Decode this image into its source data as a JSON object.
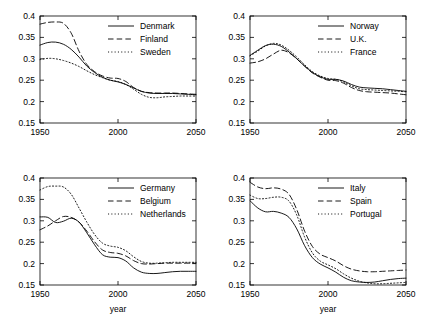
{
  "figure": {
    "width": 423,
    "height": 322,
    "background": "#ffffff",
    "line_color": "#000000"
  },
  "axes": {
    "xlabel": "year",
    "ylabel": "",
    "xlim": [
      1950,
      2050
    ],
    "ylim": [
      0.15,
      0.4
    ],
    "xticks": [
      1950,
      2000,
      2050
    ],
    "xticklabels": [
      "1950",
      "2000",
      "2050"
    ],
    "yticks": [
      0.15,
      0.2,
      0.25,
      0.3,
      0.35,
      0.4
    ],
    "yticklabels": [
      "0.15",
      "0.2",
      "0.25",
      "0.3",
      "0.35",
      "0.4"
    ],
    "grid": false,
    "legend_position": "upper right"
  },
  "chart_data": [
    {
      "type": "line",
      "panel": "top-left",
      "title": "",
      "xlabel": "",
      "ylabel": "",
      "xlim": [
        1950,
        2050
      ],
      "ylim": [
        0.15,
        0.4
      ],
      "xticks": [
        1950,
        2000,
        2050
      ],
      "yticks": [
        0.15,
        0.2,
        0.25,
        0.3,
        0.35,
        0.4
      ],
      "x": [
        1950,
        1955,
        1960,
        1965,
        1970,
        1975,
        1980,
        1985,
        1990,
        1995,
        2000,
        2005,
        2010,
        2015,
        2020,
        2025,
        2030,
        2035,
        2040,
        2045,
        2050
      ],
      "series": [
        {
          "name": "Denmark",
          "style": "solid",
          "values": [
            0.332,
            0.338,
            0.339,
            0.334,
            0.322,
            0.304,
            0.283,
            0.268,
            0.257,
            0.25,
            0.246,
            0.24,
            0.232,
            0.224,
            0.22,
            0.219,
            0.219,
            0.219,
            0.218,
            0.217,
            0.216
          ]
        },
        {
          "name": "Finland",
          "style": "dashed",
          "values": [
            0.381,
            0.385,
            0.386,
            0.383,
            0.36,
            0.318,
            0.287,
            0.27,
            0.26,
            0.255,
            0.254,
            0.247,
            0.233,
            0.224,
            0.221,
            0.22,
            0.22,
            0.22,
            0.219,
            0.218,
            0.217
          ]
        },
        {
          "name": "Sweden",
          "style": "dotted",
          "values": [
            0.298,
            0.301,
            0.3,
            0.296,
            0.29,
            0.282,
            0.272,
            0.263,
            0.256,
            0.25,
            0.247,
            0.24,
            0.229,
            0.217,
            0.21,
            0.209,
            0.211,
            0.212,
            0.213,
            0.213,
            0.213
          ]
        }
      ]
    },
    {
      "type": "line",
      "panel": "top-right",
      "title": "",
      "xlabel": "",
      "ylabel": "",
      "xlim": [
        1950,
        2050
      ],
      "ylim": [
        0.15,
        0.4
      ],
      "xticks": [
        1950,
        2000,
        2050
      ],
      "yticks": [
        0.15,
        0.2,
        0.25,
        0.3,
        0.35,
        0.4
      ],
      "x": [
        1950,
        1955,
        1960,
        1965,
        1970,
        1975,
        1980,
        1985,
        1990,
        1995,
        2000,
        2005,
        2010,
        2015,
        2020,
        2025,
        2030,
        2035,
        2040,
        2045,
        2050
      ],
      "series": [
        {
          "name": "Norway",
          "style": "solid",
          "values": [
            0.308,
            0.32,
            0.331,
            0.334,
            0.329,
            0.316,
            0.3,
            0.283,
            0.268,
            0.258,
            0.252,
            0.252,
            0.248,
            0.24,
            0.234,
            0.232,
            0.231,
            0.23,
            0.228,
            0.226,
            0.224
          ]
        },
        {
          "name": "U.K.",
          "style": "dashed",
          "values": [
            0.29,
            0.293,
            0.3,
            0.311,
            0.32,
            0.314,
            0.3,
            0.283,
            0.267,
            0.257,
            0.25,
            0.249,
            0.243,
            0.233,
            0.226,
            0.223,
            0.222,
            0.221,
            0.22,
            0.218,
            0.216
          ]
        },
        {
          "name": "France",
          "style": "dotted",
          "values": [
            0.307,
            0.318,
            0.33,
            0.336,
            0.332,
            0.32,
            0.304,
            0.286,
            0.27,
            0.26,
            0.254,
            0.252,
            0.246,
            0.237,
            0.23,
            0.228,
            0.227,
            0.226,
            0.225,
            0.224,
            0.223
          ]
        }
      ]
    },
    {
      "type": "line",
      "panel": "bottom-left",
      "title": "",
      "xlabel": "year",
      "ylabel": "",
      "xlim": [
        1950,
        2050
      ],
      "ylim": [
        0.15,
        0.4
      ],
      "xticks": [
        1950,
        2000,
        2050
      ],
      "yticks": [
        0.15,
        0.2,
        0.25,
        0.3,
        0.35,
        0.4
      ],
      "x": [
        1950,
        1955,
        1960,
        1965,
        1970,
        1975,
        1980,
        1985,
        1990,
        1995,
        2000,
        2005,
        2010,
        2015,
        2020,
        2025,
        2030,
        2035,
        2040,
        2045,
        2050
      ],
      "series": [
        {
          "name": "Germany",
          "style": "solid",
          "values": [
            0.309,
            0.308,
            0.296,
            0.299,
            0.306,
            0.297,
            0.272,
            0.244,
            0.221,
            0.215,
            0.214,
            0.206,
            0.19,
            0.18,
            0.177,
            0.177,
            0.179,
            0.181,
            0.182,
            0.182,
            0.182
          ]
        },
        {
          "name": "Belgium",
          "style": "dashed",
          "values": [
            0.279,
            0.288,
            0.3,
            0.31,
            0.308,
            0.297,
            0.276,
            0.251,
            0.232,
            0.226,
            0.224,
            0.218,
            0.207,
            0.2,
            0.199,
            0.2,
            0.201,
            0.201,
            0.201,
            0.201,
            0.201
          ]
        },
        {
          "name": "Netherlands",
          "style": "dotted",
          "values": [
            0.372,
            0.38,
            0.381,
            0.379,
            0.362,
            0.33,
            0.297,
            0.268,
            0.248,
            0.241,
            0.238,
            0.23,
            0.216,
            0.205,
            0.201,
            0.201,
            0.202,
            0.203,
            0.203,
            0.203,
            0.203
          ]
        }
      ]
    },
    {
      "type": "line",
      "panel": "bottom-right",
      "title": "",
      "xlabel": "year",
      "ylabel": "",
      "xlim": [
        1950,
        2050
      ],
      "ylim": [
        0.15,
        0.4
      ],
      "xticks": [
        1950,
        2000,
        2050
      ],
      "yticks": [
        0.15,
        0.2,
        0.25,
        0.3,
        0.35,
        0.4
      ],
      "x": [
        1950,
        1955,
        1960,
        1965,
        1970,
        1975,
        1980,
        1985,
        1990,
        1995,
        2000,
        2005,
        2010,
        2015,
        2020,
        2025,
        2030,
        2035,
        2040,
        2045,
        2050
      ],
      "series": [
        {
          "name": "Italy",
          "style": "solid",
          "values": [
            0.347,
            0.33,
            0.321,
            0.322,
            0.318,
            0.308,
            0.281,
            0.242,
            0.214,
            0.199,
            0.19,
            0.18,
            0.168,
            0.16,
            0.157,
            0.156,
            0.157,
            0.16,
            0.163,
            0.165,
            0.166
          ]
        },
        {
          "name": "Spain",
          "style": "dashed",
          "values": [
            0.39,
            0.379,
            0.375,
            0.377,
            0.374,
            0.362,
            0.326,
            0.276,
            0.24,
            0.222,
            0.214,
            0.206,
            0.195,
            0.187,
            0.183,
            0.181,
            0.181,
            0.182,
            0.183,
            0.184,
            0.185
          ]
        },
        {
          "name": "Portugal",
          "style": "dotted",
          "values": [
            0.36,
            0.352,
            0.352,
            0.355,
            0.355,
            0.346,
            0.313,
            0.262,
            0.225,
            0.206,
            0.197,
            0.188,
            0.176,
            0.166,
            0.159,
            0.155,
            0.153,
            0.153,
            0.154,
            0.155,
            0.156
          ]
        }
      ]
    }
  ]
}
